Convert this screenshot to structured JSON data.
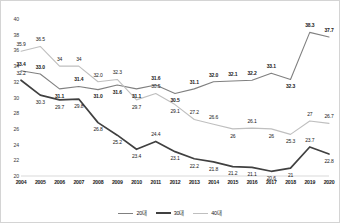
{
  "chart_data": {
    "type": "line",
    "title": "",
    "subtitle": "",
    "xlabel": "",
    "ylabel": "",
    "grid": false,
    "legend_position": "bottom",
    "categories": [
      "2004",
      "2005",
      "2006",
      "2007",
      "2008",
      "2009",
      "2010",
      "2011",
      "2012",
      "2013",
      "2014",
      "2015",
      "2016",
      "2017",
      "2018",
      "2019",
      "2020"
    ],
    "ylim": [
      20,
      40
    ],
    "yticks": [
      20,
      22,
      24,
      26,
      28,
      30,
      32,
      34,
      36,
      38,
      40
    ],
    "ytick_labels": [
      "20",
      "22",
      "24",
      "26",
      "28",
      "30",
      "32",
      "34",
      "36",
      "38",
      "40"
    ],
    "series": [
      {
        "name": "20대",
        "color": "#808080",
        "width": 1.1,
        "values": [
          33.4,
          33.0,
          31.1,
          31.4,
          31.0,
          31.6,
          31.1,
          31.6,
          30.5,
          31.1,
          32.0,
          32.1,
          32.2,
          33.1,
          32.3,
          38.3,
          37.7
        ],
        "labels": [
          "33.4",
          "33.0",
          "31.1",
          "31.4",
          "31.0",
          "31.6",
          "31.1",
          "31.6",
          "30.5",
          "31.1",
          "32.0",
          "32.1",
          "32.2",
          "33.1",
          "32.3",
          "38.3",
          "37.7"
        ]
      },
      {
        "name": "30대",
        "color": "#404040",
        "width": 1.7,
        "values": [
          32.2,
          30.3,
          29.7,
          29.8,
          26.8,
          25.2,
          23.4,
          24.4,
          23.1,
          22.2,
          21.8,
          21.2,
          21.1,
          20.6,
          21.0,
          23.7,
          22.8
        ],
        "labels": [
          "32.2",
          "30.3",
          "29.7",
          "29.8",
          "26.8",
          "25.2",
          "23.4",
          "24.4",
          "23.1",
          "22.2",
          "21.8",
          "21.2",
          "21.1",
          "20.6",
          "21",
          "23.7",
          "22.8"
        ]
      },
      {
        "name": "40대",
        "color": "#bfbfbf",
        "width": 1.1,
        "values": [
          35.9,
          36.5,
          34.0,
          34.0,
          32.0,
          32.3,
          29.7,
          30.5,
          29.1,
          27.2,
          26.6,
          26.0,
          26.1,
          26.0,
          25.3,
          27.0,
          26.7
        ],
        "labels": [
          "35.9",
          "36.5",
          "34",
          "34",
          "32.0",
          "32.3",
          "29.7",
          "30.5",
          "29.1",
          "27.2",
          "26.6",
          "26",
          "26.1",
          "26",
          "25.3",
          "27",
          "26.7"
        ]
      }
    ],
    "label_offsets": {
      "20대": [
        -7,
        -7,
        7,
        -7,
        7,
        7,
        7,
        -7,
        7,
        -7,
        -7,
        -7,
        -7,
        -7,
        7,
        -7,
        -7
      ],
      "30대": [
        -7,
        7,
        7,
        7,
        7,
        7,
        7,
        -7,
        7,
        7,
        7,
        7,
        7,
        7,
        7,
        -7,
        7
      ],
      "40대": [
        -7,
        -7,
        -7,
        -7,
        -7,
        -7,
        7,
        -7,
        7,
        -7,
        -7,
        7,
        -7,
        7,
        7,
        -7,
        -7
      ]
    },
    "label_bold": {
      "20대": [
        true,
        true,
        true,
        true,
        true,
        true,
        true,
        true,
        true,
        true,
        true,
        true,
        true,
        true,
        true,
        true,
        true
      ],
      "30대": [
        false,
        false,
        false,
        false,
        false,
        false,
        false,
        false,
        false,
        false,
        false,
        false,
        false,
        false,
        false,
        false,
        false
      ],
      "40대": [
        false,
        false,
        false,
        false,
        false,
        false,
        false,
        false,
        false,
        false,
        false,
        false,
        false,
        false,
        false,
        false,
        false
      ]
    }
  }
}
